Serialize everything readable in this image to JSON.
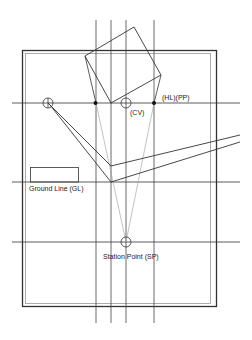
{
  "diagram": {
    "type": "two-point perspective construction",
    "colors": {
      "line": "#333333",
      "light_line": "#9a9a9a",
      "background": "#ffffff"
    },
    "labels": {
      "horizon_picture_plane": "(HL)(PP)",
      "center_of_vision": "(CV)",
      "ground_line": "Ground Line (GL)",
      "station_point": "Station Point (SP)"
    },
    "elements": [
      {
        "name": "frame",
        "kind": "double rectangle"
      },
      {
        "name": "horizon-line",
        "kind": "horizontal line",
        "note": "also picture plane"
      },
      {
        "name": "ground-line",
        "kind": "horizontal line"
      },
      {
        "name": "station-point-line",
        "kind": "horizontal line"
      },
      {
        "name": "plan-square",
        "kind": "rotated square (plan view)"
      },
      {
        "name": "vanishing-point-left",
        "kind": "circle marker"
      },
      {
        "name": "center-of-vision",
        "kind": "circle marker"
      },
      {
        "name": "station-point",
        "kind": "circle marker"
      },
      {
        "name": "projection-lines",
        "kind": "vertical lines",
        "count": 4
      },
      {
        "name": "intersection-dots",
        "kind": "filled dots",
        "count": 2
      }
    ]
  }
}
